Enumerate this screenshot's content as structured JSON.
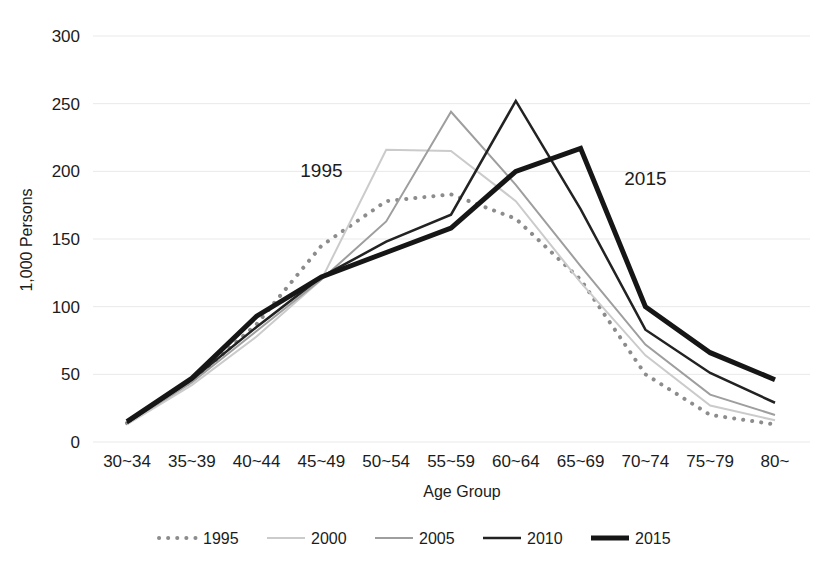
{
  "chart_data": {
    "type": "line",
    "title": "",
    "xlabel": "Age Group",
    "ylabel": "1,000 Persons",
    "ylim": [
      0,
      300
    ],
    "yticks": [
      0,
      50,
      100,
      150,
      200,
      250,
      300
    ],
    "grid": true,
    "legend_position": "bottom",
    "categories": [
      "30~34",
      "35~39",
      "40~44",
      "45~49",
      "50~54",
      "55~59",
      "60~64",
      "65~69",
      "70~74",
      "75~79",
      "80~"
    ],
    "series": [
      {
        "name": "1995",
        "style": "dotted",
        "color": "#8c8c8c",
        "width": 4,
        "values": [
          14,
          45,
          87,
          145,
          178,
          183,
          165,
          120,
          50,
          20,
          13
        ]
      },
      {
        "name": "2000",
        "style": "solid",
        "color": "#cbcbcb",
        "width": 2,
        "values": [
          13,
          42,
          78,
          120,
          216,
          215,
          178,
          118,
          64,
          27,
          16
        ]
      },
      {
        "name": "2005",
        "style": "solid",
        "color": "#9e9e9e",
        "width": 2,
        "values": [
          14,
          44,
          82,
          120,
          163,
          244,
          190,
          130,
          72,
          35,
          20
        ]
      },
      {
        "name": "2010",
        "style": "solid",
        "color": "#222222",
        "width": 2.5,
        "values": [
          14,
          46,
          85,
          122,
          148,
          168,
          252,
          172,
          83,
          51,
          29
        ]
      },
      {
        "name": "2015",
        "style": "solid",
        "color": "#161616",
        "width": 5,
        "values": [
          15,
          47,
          93,
          122,
          140,
          158,
          200,
          217,
          100,
          66,
          46
        ]
      }
    ],
    "annotations": [
      {
        "text": "1995",
        "x_category": "45~49",
        "y_value": 196
      },
      {
        "text": "2015",
        "x_category": "70~74",
        "y_value": 190
      }
    ]
  },
  "legend": {
    "items": [
      {
        "label": "1995"
      },
      {
        "label": "2000"
      },
      {
        "label": "2005"
      },
      {
        "label": "2010"
      },
      {
        "label": "2015"
      }
    ]
  }
}
